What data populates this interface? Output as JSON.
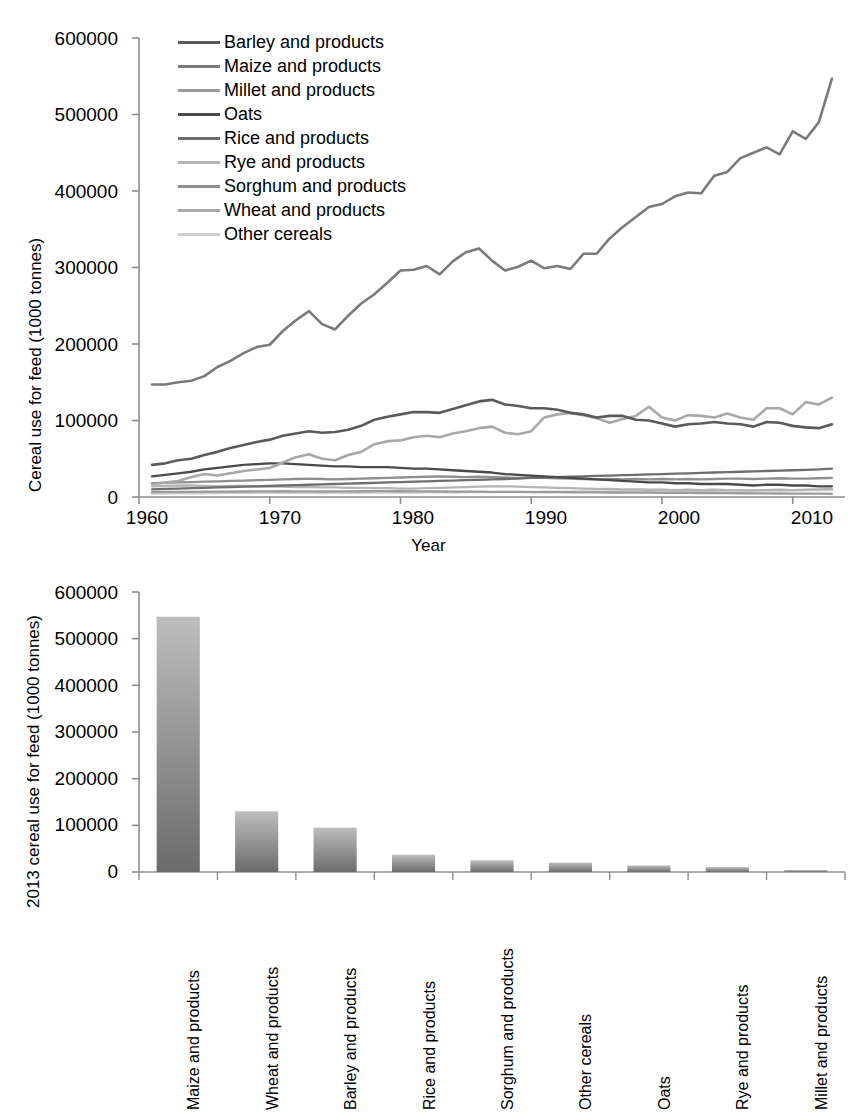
{
  "chart_data": [
    {
      "type": "line",
      "title": "",
      "xlabel": "Year",
      "ylabel": "Cereal use for feed (1000 tonnes)",
      "xlim": [
        1960,
        2014
      ],
      "ylim": [
        0,
        600000
      ],
      "xticks": [
        "1960",
        "1970",
        "1980",
        "1990",
        "2000",
        "2010"
      ],
      "xtick_values": [
        1960,
        1970,
        1980,
        1990,
        2000,
        2010
      ],
      "yticks": [
        "0",
        "100000",
        "200000",
        "300000",
        "400000",
        "500000",
        "600000"
      ],
      "ytick_values": [
        0,
        100000,
        200000,
        300000,
        400000,
        500000,
        600000
      ],
      "grid": false,
      "legend_position": "top-left-inside",
      "x": [
        1961,
        1962,
        1963,
        1964,
        1965,
        1966,
        1967,
        1968,
        1969,
        1970,
        1971,
        1972,
        1973,
        1974,
        1975,
        1976,
        1977,
        1978,
        1979,
        1980,
        1981,
        1982,
        1983,
        1984,
        1985,
        1986,
        1987,
        1988,
        1989,
        1990,
        1991,
        1992,
        1993,
        1994,
        1995,
        1996,
        1997,
        1998,
        1999,
        2000,
        2001,
        2002,
        2003,
        2004,
        2005,
        2006,
        2007,
        2008,
        2009,
        2010,
        2011,
        2012,
        2013
      ],
      "series": [
        {
          "name": "Barley and products",
          "color": "#5a5a5a",
          "values": [
            42000,
            44000,
            48000,
            50000,
            55000,
            59000,
            64000,
            68000,
            72000,
            75000,
            80000,
            83000,
            86000,
            84000,
            85000,
            88000,
            93000,
            101000,
            105000,
            108000,
            111000,
            111000,
            110000,
            115000,
            120000,
            125000,
            127000,
            121000,
            119000,
            116000,
            116000,
            114000,
            110000,
            108000,
            104000,
            106000,
            106000,
            101000,
            100000,
            96000,
            92000,
            95000,
            96000,
            98000,
            96000,
            95000,
            92000,
            98000,
            97000,
            93000,
            91000,
            90000,
            95000
          ]
        },
        {
          "name": "Maize and products",
          "color": "#7a7a7a",
          "values": [
            147000,
            147000,
            150000,
            152000,
            158000,
            170000,
            178000,
            188000,
            196000,
            199000,
            217000,
            231000,
            243000,
            226000,
            219000,
            237000,
            253000,
            265000,
            280000,
            296000,
            297000,
            302000,
            291000,
            308000,
            320000,
            325000,
            309000,
            296000,
            301000,
            309000,
            299000,
            302000,
            298000,
            318000,
            318000,
            338000,
            353000,
            366000,
            379000,
            383000,
            393000,
            398000,
            397000,
            420000,
            425000,
            443000,
            450000,
            457000,
            448000,
            478000,
            468000,
            490000,
            547000
          ]
        },
        {
          "name": "Millet and products",
          "color": "#9b9b9b",
          "values": [
            6500,
            6600,
            6700,
            6800,
            6900,
            7000,
            7100,
            7200,
            7300,
            7400,
            7500,
            7400,
            7300,
            7200,
            7300,
            7400,
            7500,
            7600,
            7600,
            7500,
            7400,
            7300,
            7200,
            7100,
            7000,
            6900,
            6800,
            6700,
            6600,
            6500,
            6400,
            6300,
            6200,
            6100,
            6000,
            5900,
            5800,
            5700,
            5600,
            5500,
            5400,
            5300,
            5200,
            5100,
            5000,
            4900,
            4800,
            4700,
            4600,
            4500,
            4400,
            4300,
            4200
          ]
        },
        {
          "name": "Oats",
          "color": "#4a4a4a",
          "values": [
            27000,
            29000,
            31000,
            33000,
            36000,
            38000,
            40000,
            42000,
            43000,
            44000,
            44000,
            43000,
            42000,
            41000,
            40000,
            40000,
            39000,
            39000,
            39000,
            38000,
            37000,
            37000,
            36000,
            35000,
            34000,
            33000,
            32000,
            30000,
            29000,
            28000,
            27000,
            26000,
            25000,
            24000,
            23000,
            22000,
            21000,
            20000,
            19000,
            19000,
            18000,
            18000,
            17000,
            17000,
            17000,
            16000,
            15000,
            16000,
            16000,
            15000,
            15000,
            14000,
            14000
          ]
        },
        {
          "name": "Rice and products",
          "color": "#6e6e6e",
          "values": [
            10000,
            10500,
            11000,
            11500,
            12000,
            12500,
            13000,
            13500,
            14000,
            14500,
            15000,
            15500,
            16000,
            16500,
            17000,
            17500,
            18000,
            18500,
            19000,
            19500,
            20000,
            20500,
            21000,
            21500,
            22000,
            22500,
            23000,
            23500,
            24000,
            25000,
            25500,
            26000,
            26500,
            27000,
            27500,
            28000,
            28500,
            29000,
            29500,
            30000,
            30500,
            31000,
            31500,
            32000,
            32500,
            33000,
            33500,
            34000,
            34500,
            35000,
            35500,
            36000,
            37000
          ]
        },
        {
          "name": "Rye and products",
          "color": "#b4b4b4",
          "values": [
            14000,
            14500,
            15000,
            15000,
            14500,
            14000,
            14500,
            14500,
            14000,
            13500,
            13500,
            13000,
            13000,
            12500,
            12500,
            12000,
            12000,
            11500,
            11500,
            11000,
            11000,
            11500,
            12000,
            12500,
            13000,
            13500,
            14000,
            14000,
            13500,
            13000,
            12500,
            12000,
            11500,
            11000,
            10500,
            10500,
            10000,
            10000,
            9500,
            9500,
            9000,
            9500,
            9000,
            9500,
            9000,
            9000,
            8500,
            9000,
            9500,
            9000,
            9500,
            10000,
            10500
          ]
        },
        {
          "name": "Sorghum and products",
          "color": "#8f8f8f",
          "values": [
            18000,
            18500,
            19000,
            19500,
            20000,
            20500,
            21000,
            21500,
            22000,
            22500,
            23000,
            23500,
            24000,
            23500,
            23000,
            23500,
            24000,
            24500,
            25000,
            25500,
            26000,
            26500,
            27000,
            26500,
            26000,
            26500,
            26000,
            25500,
            25000,
            25500,
            25000,
            24500,
            24000,
            23500,
            23000,
            23500,
            23000,
            23500,
            23000,
            23500,
            23000,
            23500,
            23000,
            23500,
            24000,
            24000,
            23500,
            24000,
            24500,
            24000,
            24000,
            24500,
            25000
          ]
        },
        {
          "name": "Wheat and products",
          "color": "#a8a8a8",
          "values": [
            17000,
            19000,
            21000,
            26000,
            30000,
            28000,
            31000,
            34000,
            36000,
            38000,
            45000,
            52000,
            56000,
            50000,
            48000,
            55000,
            59000,
            69000,
            73000,
            74000,
            78000,
            80000,
            78000,
            83000,
            86000,
            90000,
            92000,
            84000,
            82000,
            86000,
            104000,
            108000,
            110000,
            107000,
            103000,
            97000,
            102000,
            106000,
            118000,
            104000,
            100000,
            107000,
            106000,
            104000,
            109000,
            104000,
            101000,
            116000,
            116000,
            108000,
            124000,
            121000,
            130000
          ]
        },
        {
          "name": "Other cereals",
          "color": "#cfcfcf",
          "values": [
            4500,
            4600,
            4700,
            4800,
            4900,
            5000,
            5100,
            5200,
            5300,
            5400,
            5500,
            5400,
            5300,
            5200,
            5300,
            5400,
            5500,
            5600,
            5700,
            5800,
            5900,
            6000,
            6100,
            6200,
            6300,
            6400,
            6500,
            6600,
            6700,
            6800,
            6900,
            7000,
            7100,
            7200,
            7300,
            7400,
            7500,
            7600,
            7700,
            7800,
            7900,
            8000,
            8100,
            8200,
            8300,
            8400,
            8500,
            8600,
            8700,
            8800,
            8900,
            9000,
            9100
          ]
        }
      ]
    },
    {
      "type": "bar",
      "title": "",
      "xlabel": "",
      "ylabel": "2013 cereal use for feed (1000 tonnes)",
      "ylim": [
        0,
        600000
      ],
      "yticks": [
        "0",
        "100000",
        "200000",
        "300000",
        "400000",
        "500000",
        "600000"
      ],
      "ytick_values": [
        0,
        100000,
        200000,
        300000,
        400000,
        500000,
        600000
      ],
      "grid": false,
      "bar_gradient_top": "#bdbdbd",
      "bar_gradient_bottom": "#6b6b6b",
      "categories": [
        "Maize and products",
        "Wheat and products",
        "Barley and products",
        "Rice and products",
        "Sorghum and products",
        "Other cereals",
        "Oats",
        "Rye and products",
        "Millet and products"
      ],
      "values": [
        547000,
        130000,
        95000,
        37000,
        25000,
        20000,
        14000,
        10500,
        4200
      ]
    }
  ],
  "top_chart": {
    "ylabel": "Cereal use for feed (1000 tonnes)",
    "xlabel": "Year",
    "legend_items": [
      {
        "label": "Barley and products",
        "color": "#5a5a5a"
      },
      {
        "label": "Maize and products",
        "color": "#7a7a7a"
      },
      {
        "label": "Millet and products",
        "color": "#9b9b9b"
      },
      {
        "label": "Oats",
        "color": "#4a4a4a"
      },
      {
        "label": "Rice and products",
        "color": "#6e6e6e"
      },
      {
        "label": "Rye and products",
        "color": "#b4b4b4"
      },
      {
        "label": "Sorghum and products",
        "color": "#8f8f8f"
      },
      {
        "label": "Wheat and products",
        "color": "#a8a8a8"
      },
      {
        "label": "Other cereals",
        "color": "#cfcfcf"
      }
    ],
    "yticks": [
      "600000",
      "500000",
      "400000",
      "300000",
      "200000",
      "100000",
      "0"
    ],
    "xticks": [
      "1960",
      "1970",
      "1980",
      "1990",
      "2000",
      "2010"
    ]
  },
  "bottom_chart": {
    "ylabel": "2013 cereal use for feed (1000 tonnes)",
    "yticks": [
      "600000",
      "500000",
      "400000",
      "300000",
      "200000",
      "100000",
      "0"
    ],
    "categories": [
      "Maize and products",
      "Wheat and products",
      "Barley and products",
      "Rice and products",
      "Sorghum and products",
      "Other cereals",
      "Oats",
      "Rye and products",
      "Millet and products"
    ]
  },
  "colors": {
    "axis": "#8c8c8c",
    "text": "#000000",
    "background": "#ffffff"
  }
}
